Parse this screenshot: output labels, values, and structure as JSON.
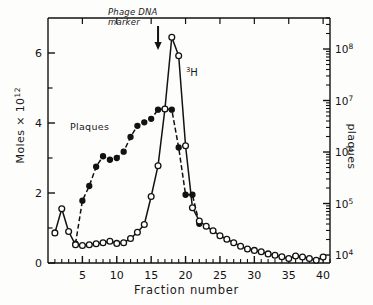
{
  "figure": {
    "background_color": "#fdfdfc",
    "ink_color": "#121212"
  },
  "axes": {
    "x": {
      "label": "Fraction number",
      "ticks": [
        5,
        10,
        15,
        20,
        25,
        30,
        35,
        40
      ],
      "min": 0,
      "max": 41,
      "minor_tick_step": 1
    },
    "y_left": {
      "label_text": "Moles × 10",
      "label_exponent": "12",
      "ticks": [
        0,
        2,
        4,
        6
      ],
      "minor_ticks": [
        1,
        3,
        5
      ],
      "min": 0,
      "max": 7,
      "scale": "linear"
    },
    "y_right": {
      "label": "plaques",
      "tick_mantissa": "10",
      "tick_exponents": [
        "4",
        "5",
        "6",
        "7",
        "8"
      ],
      "tick_values": [
        10000,
        100000,
        1000000,
        10000000,
        100000000
      ],
      "min": 7000,
      "max": 400000000,
      "scale": "log"
    }
  },
  "annotations": {
    "phage_marker": {
      "line1": "Phage DNA",
      "line2": "marker",
      "arrow_fraction": 16
    },
    "tritium_label": "3H",
    "tritium_superscript": "3",
    "tritium_base": "H",
    "plaques_label": "Plaques"
  },
  "chart_data": {
    "type": "line",
    "title": "",
    "xlabel": "Fraction number",
    "ylabel": "Moles x 10^12",
    "ylabel_right": "plaques",
    "xlim": [
      0,
      41
    ],
    "ylim": [
      0,
      7
    ],
    "ylim_right": [
      7000,
      400000000
    ],
    "y_right_scale": "log",
    "grid": false,
    "legend": "inline-annotations",
    "x": [
      1,
      2,
      3,
      4,
      5,
      6,
      7,
      8,
      9,
      10,
      11,
      12,
      13,
      14,
      15,
      16,
      17,
      18,
      19,
      20,
      21,
      22,
      23,
      24,
      25,
      26,
      27,
      28,
      29,
      30,
      31,
      32,
      33,
      34,
      35,
      36,
      37,
      38,
      39,
      40
    ],
    "series": [
      {
        "name": "3H",
        "marker": "open-circle",
        "axis": "left",
        "units": "Moles x 10^12",
        "values": [
          0.86,
          1.55,
          0.9,
          0.52,
          0.5,
          0.52,
          0.55,
          0.58,
          0.62,
          0.56,
          0.58,
          0.7,
          0.88,
          1.1,
          1.9,
          2.78,
          4.4,
          6.45,
          5.92,
          3.35,
          1.58,
          1.2,
          1.05,
          0.92,
          0.78,
          0.68,
          0.58,
          0.48,
          0.4,
          0.36,
          0.32,
          0.26,
          0.22,
          0.18,
          0.13,
          0.2,
          0.17,
          0.13,
          0.08,
          0.17
        ]
      },
      {
        "name": "Plaques",
        "marker": "filled-circle",
        "axis": "right",
        "units": "plaques",
        "values_as_left_axis": [
          null,
          null,
          null,
          0.55,
          1.78,
          2.2,
          2.75,
          3.05,
          2.95,
          3.0,
          3.18,
          3.6,
          3.92,
          4.02,
          4.12,
          4.38,
          4.4,
          4.38,
          3.3,
          1.95,
          1.95,
          1.12,
          null,
          null,
          null,
          null,
          null,
          null,
          null,
          null,
          null,
          null,
          null,
          null,
          null,
          null,
          null,
          null,
          null,
          null
        ],
        "values": [
          null,
          null,
          null,
          18000,
          170000,
          300000,
          700000,
          1300000,
          1050000,
          1150000,
          1600000,
          3500000,
          6500000,
          7800000,
          9500000,
          18000000,
          19000000,
          18000000,
          3600000,
          260000,
          260000,
          62000,
          null,
          null,
          null,
          null,
          null,
          null,
          null,
          null,
          null,
          null,
          null,
          null,
          null,
          null,
          null,
          null,
          null,
          null
        ]
      }
    ]
  }
}
